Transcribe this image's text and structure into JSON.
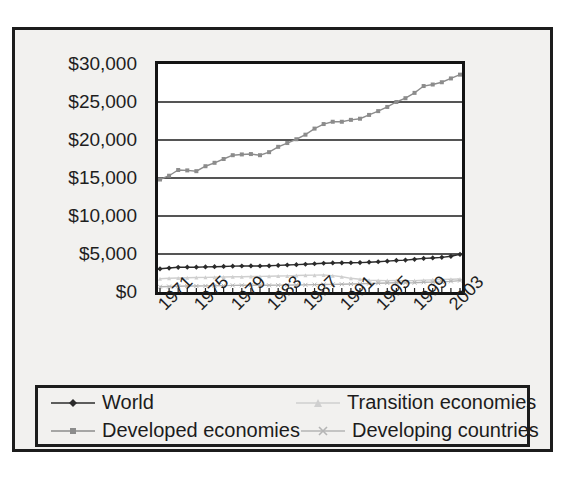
{
  "chart_data": {
    "type": "line",
    "title": "",
    "xlabel": "",
    "ylabel": "",
    "ylim": [
      0,
      30000
    ],
    "yticks": [
      0,
      5000,
      10000,
      15000,
      20000,
      25000,
      30000
    ],
    "ytick_labels": [
      "$0",
      "$5,000",
      "$10,000",
      "$15,000",
      "$20,000",
      "$25,000",
      "$30,000"
    ],
    "grid": true,
    "legend_position": "bottom",
    "x": [
      1971,
      1972,
      1973,
      1974,
      1975,
      1976,
      1977,
      1978,
      1979,
      1980,
      1981,
      1982,
      1983,
      1984,
      1985,
      1986,
      1987,
      1988,
      1989,
      1990,
      1991,
      1992,
      1993,
      1994,
      1995,
      1996,
      1997,
      1998,
      1999,
      2000,
      2001,
      2002,
      2003,
      2004
    ],
    "xtick_labels": [
      "1971",
      "1975",
      "1979",
      "1983",
      "1987",
      "1991",
      "1995",
      "1999",
      "2003"
    ],
    "xtick_values": [
      1971,
      1975,
      1979,
      1983,
      1987,
      1991,
      1995,
      1999,
      2003
    ],
    "xtick_rotation": -45,
    "series": [
      {
        "name": "World",
        "marker": "diamond",
        "color": "#2b2b2b",
        "values": [
          3050,
          3150,
          3250,
          3270,
          3260,
          3300,
          3330,
          3360,
          3400,
          3420,
          3430,
          3420,
          3450,
          3500,
          3550,
          3600,
          3650,
          3720,
          3780,
          3820,
          3840,
          3850,
          3870,
          3920,
          3980,
          4060,
          4150,
          4200,
          4300,
          4420,
          4480,
          4560,
          4700,
          4950
        ]
      },
      {
        "name": "Developed economies",
        "marker": "square",
        "color": "#8c8c8c",
        "values": [
          14800,
          15300,
          16050,
          16000,
          15900,
          16550,
          17000,
          17500,
          18000,
          18100,
          18150,
          18000,
          18400,
          19100,
          19600,
          20100,
          20700,
          21500,
          22100,
          22400,
          22400,
          22650,
          22800,
          23300,
          23800,
          24350,
          25000,
          25500,
          26200,
          27100,
          27300,
          27600,
          28100,
          28600
        ]
      },
      {
        "name": "Transition economies",
        "marker": "triangle",
        "color": "#cfcfcf",
        "values": [
          1750,
          1800,
          1850,
          1880,
          1900,
          1930,
          1950,
          1980,
          2000,
          2010,
          2030,
          2050,
          2080,
          2100,
          2120,
          2180,
          2200,
          2220,
          2230,
          2150,
          2000,
          1800,
          1680,
          1560,
          1520,
          1500,
          1520,
          1480,
          1500,
          1560,
          1600,
          1640,
          1680,
          1720
        ]
      },
      {
        "name": "Developing countries",
        "marker": "cross",
        "color": "#b5b5b5",
        "values": [
          700,
          720,
          760,
          780,
          790,
          800,
          820,
          840,
          870,
          880,
          890,
          880,
          880,
          900,
          910,
          920,
          940,
          970,
          990,
          1000,
          1020,
          1050,
          1080,
          1110,
          1150,
          1190,
          1230,
          1200,
          1220,
          1280,
          1300,
          1330,
          1400,
          1500
        ]
      }
    ]
  },
  "legend": {
    "items": [
      {
        "label": "World",
        "marker": "diamond",
        "color": "#2b2b2b"
      },
      {
        "label": "Transition economies",
        "marker": "triangle",
        "color": "#cfcfcf"
      },
      {
        "label": "Developed economies",
        "marker": "square",
        "color": "#8c8c8c"
      },
      {
        "label": "Developing countries",
        "marker": "cross",
        "color": "#b5b5b5"
      }
    ]
  }
}
